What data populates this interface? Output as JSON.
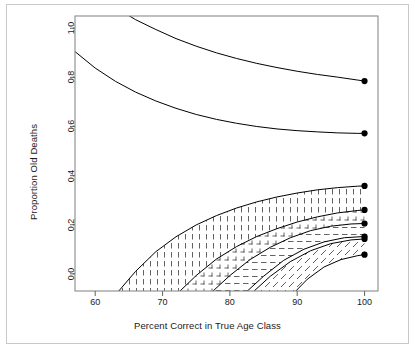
{
  "chart_data": {
    "type": "line",
    "title": "",
    "subtitle": "",
    "xlabel": "Percent Correct in True Age Class",
    "ylabel": "Proportion Old Deaths",
    "xlim": [
      57.0,
      102.0
    ],
    "ylim": [
      -0.07,
      1.05
    ],
    "xticks": [
      60,
      70,
      80,
      90,
      100
    ],
    "xtick_labels": [
      "60",
      "70",
      "80",
      "90",
      "100"
    ],
    "yticks": [
      0.0,
      0.2,
      0.4,
      0.6,
      0.8,
      1.0
    ],
    "ytick_labels": [
      "0.0",
      "0.2",
      "0.4",
      "0.6",
      "0.8",
      "1.0"
    ],
    "grid": false,
    "legend": "none",
    "background": "#ffffff",
    "line_color": "#000000",
    "point_color": "#000000",
    "frame_color": "#808080",
    "series": [
      {
        "name": "upper-curve-1",
        "endpoint": {
          "x": 100,
          "y": 0.785
        },
        "x": [
          57,
          60,
          63,
          66,
          69,
          72,
          75,
          78,
          81,
          84,
          87,
          90,
          93,
          96,
          99,
          100
        ],
        "y": [
          1.2,
          1.14,
          1.085,
          1.035,
          0.995,
          0.958,
          0.927,
          0.9,
          0.877,
          0.857,
          0.84,
          0.825,
          0.812,
          0.801,
          0.789,
          0.785
        ]
      },
      {
        "name": "upper-curve-2",
        "endpoint": {
          "x": 100,
          "y": 0.572
        },
        "x": [
          57,
          60,
          63,
          66,
          69,
          72,
          75,
          78,
          81,
          84,
          87,
          90,
          93,
          96,
          99,
          100
        ],
        "y": [
          0.905,
          0.838,
          0.784,
          0.74,
          0.704,
          0.674,
          0.649,
          0.629,
          0.613,
          0.6,
          0.59,
          0.583,
          0.578,
          0.574,
          0.572,
          0.572
        ]
      },
      {
        "name": "band-a-upper",
        "endpoint": {
          "x": 100,
          "y": 0.358
        },
        "x": [
          63.5,
          66,
          69,
          72,
          75,
          78,
          81,
          84,
          87,
          90,
          93,
          96,
          99,
          100
        ],
        "y": [
          -0.07,
          0.01,
          0.09,
          0.151,
          0.199,
          0.237,
          0.268,
          0.293,
          0.313,
          0.329,
          0.342,
          0.351,
          0.357,
          0.358
        ]
      },
      {
        "name": "band-a-lower",
        "endpoint": {
          "x": 100,
          "y": 0.26
        },
        "x": [
          72.6,
          75,
          78,
          81,
          84,
          87,
          90,
          93,
          96,
          99,
          100
        ],
        "y": [
          -0.07,
          -0.007,
          0.06,
          0.111,
          0.152,
          0.184,
          0.211,
          0.232,
          0.248,
          0.258,
          0.26
        ]
      },
      {
        "name": "band-b-lower",
        "endpoint": {
          "x": 100,
          "y": 0.205
        },
        "x": [
          77.5,
          80,
          83,
          86,
          89,
          92,
          95,
          98,
          100
        ],
        "y": [
          -0.07,
          -0.007,
          0.058,
          0.108,
          0.147,
          0.176,
          0.194,
          0.203,
          0.205
        ]
      },
      {
        "name": "band-c-lower-1",
        "endpoint": {
          "x": 100,
          "y": 0.152
        },
        "x": [
          82.6,
          85,
          88,
          91,
          94,
          97,
          100
        ],
        "y": [
          -0.07,
          -0.01,
          0.055,
          0.1,
          0.13,
          0.147,
          0.152
        ]
      },
      {
        "name": "band-c-lower-2",
        "endpoint": {
          "x": 100,
          "y": 0.142
        },
        "x": [
          83.6,
          86,
          89,
          92,
          95,
          98,
          100
        ],
        "y": [
          -0.07,
          -0.01,
          0.05,
          0.094,
          0.123,
          0.138,
          0.142
        ]
      },
      {
        "name": "band-d-lower",
        "endpoint": {
          "x": 100,
          "y": 0.078
        },
        "x": [
          89.8,
          91.5,
          94,
          96.5,
          99,
          100
        ],
        "y": [
          -0.07,
          -0.022,
          0.028,
          0.058,
          0.074,
          0.078
        ]
      }
    ],
    "endpoint_markers": [
      {
        "x": 100,
        "y": 0.785
      },
      {
        "x": 100,
        "y": 0.572
      },
      {
        "x": 100,
        "y": 0.358
      },
      {
        "x": 100,
        "y": 0.26
      },
      {
        "x": 100,
        "y": 0.205
      },
      {
        "x": 100,
        "y": 0.152
      },
      {
        "x": 100,
        "y": 0.142
      },
      {
        "x": 100,
        "y": 0.078
      }
    ],
    "hatch_bands": [
      {
        "name": "band-a",
        "pattern": "vertical-dashes",
        "upper": "band-a-upper",
        "lower": "band-a-lower"
      },
      {
        "name": "band-b",
        "pattern": "crosshatch-dashes",
        "upper": "band-a-lower",
        "lower": "band-b-lower"
      },
      {
        "name": "band-c",
        "pattern": "horizontal-dashes",
        "upper": "band-b-lower",
        "lower": "band-c-lower-1"
      },
      {
        "name": "band-d",
        "pattern": "diagonal-dashes",
        "upper": "band-c-lower-2",
        "lower": "band-d-lower"
      }
    ]
  }
}
